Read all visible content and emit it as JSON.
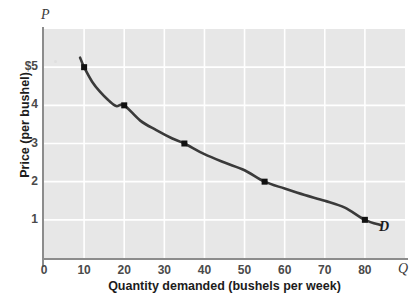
{
  "figure": {
    "axis_symbols": {
      "price": "P",
      "quantity": "Q"
    },
    "curve_label": "D",
    "background_color": "#ffffff",
    "panel_color": "#e7e7e7",
    "grid_color": "#ffffff",
    "curve_color": "#3a3a3a",
    "axis_color": "#8c8c8c"
  },
  "chart_data": {
    "type": "line",
    "title": "",
    "subtitle": "",
    "xlabel": "Quantity demanded (bushels per week)",
    "ylabel": "Price (per bushel)",
    "xlim": [
      0,
      90
    ],
    "ylim": [
      0,
      6
    ],
    "grid": true,
    "legend_position": "inline-right",
    "x_ticks": [
      0,
      10,
      20,
      30,
      40,
      50,
      60,
      70,
      80
    ],
    "x_tick_labels": [
      "0",
      "10",
      "20",
      "30",
      "40",
      "50",
      "60",
      "70",
      "80"
    ],
    "y_ticks": [
      1,
      2,
      3,
      4,
      5
    ],
    "y_tick_labels": [
      "1",
      "2",
      "3",
      "4",
      "$5"
    ],
    "series": [
      {
        "name": "D",
        "label": "D",
        "annotation": "D",
        "marked_points": [
          {
            "x": 10,
            "y": 5
          },
          {
            "x": 20,
            "y": 4
          },
          {
            "x": 35,
            "y": 3
          },
          {
            "x": 55,
            "y": 2
          },
          {
            "x": 80,
            "y": 1
          }
        ],
        "x": [
          9,
          10,
          12,
          14,
          16,
          18,
          20,
          24,
          28,
          32,
          35,
          40,
          45,
          50,
          55,
          60,
          65,
          70,
          75,
          80,
          84
        ],
        "y": [
          5.25,
          5.0,
          4.62,
          4.35,
          4.14,
          3.98,
          4.0,
          3.6,
          3.35,
          3.13,
          3.0,
          2.72,
          2.5,
          2.3,
          2.0,
          1.82,
          1.65,
          1.5,
          1.32,
          1.0,
          0.86
        ]
      }
    ]
  }
}
